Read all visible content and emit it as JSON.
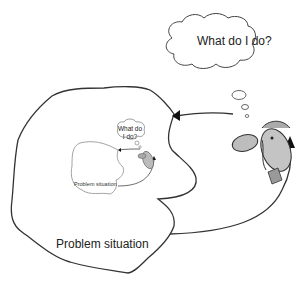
{
  "diagram": {
    "outer": {
      "thought_text": "What do I do?",
      "region_label": "Problem situation"
    },
    "inner": {
      "thought_line1": "What do",
      "thought_line2": "I do?",
      "region_label": "Problem situation"
    },
    "colors": {
      "stroke": "#333333",
      "inner_stroke": "#888888",
      "face_fill": "#bdbdbd",
      "background": "#ffffff"
    }
  }
}
